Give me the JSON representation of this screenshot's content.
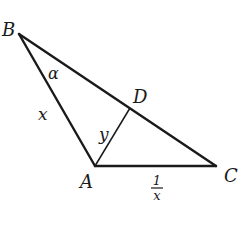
{
  "diagram": {
    "type": "triangle",
    "vertices": {
      "B": {
        "label": "B"
      },
      "A": {
        "label": "A"
      },
      "C": {
        "label": "C"
      },
      "D": {
        "label": "D"
      }
    },
    "edges": [
      {
        "from": "B",
        "to": "A",
        "label": "x"
      },
      {
        "from": "B",
        "to": "C",
        "label": ""
      },
      {
        "from": "A",
        "to": "C",
        "label": "1/x"
      },
      {
        "from": "A",
        "to": "D",
        "label": "y"
      }
    ],
    "angle_label": "α",
    "side_labels": {
      "BA": "x",
      "AD": "y",
      "AC_numerator": "1",
      "AC_denominator": "x"
    }
  }
}
